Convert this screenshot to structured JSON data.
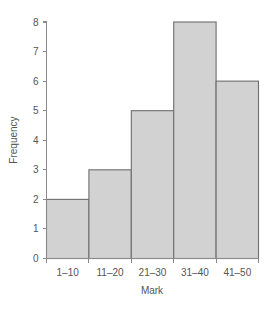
{
  "chart_data": {
    "type": "bar",
    "title": "",
    "subtitle": "",
    "xlabel": "Mark",
    "ylabel": "Frequency",
    "categories": [
      "1–10",
      "11–20",
      "21–30",
      "31–40",
      "41–50"
    ],
    "values": [
      2,
      3,
      5,
      8,
      6
    ],
    "series": [
      {
        "name": "Frequency",
        "values": [
          2,
          3,
          5,
          8,
          6
        ]
      }
    ],
    "ylim": [
      0,
      8
    ],
    "xlim": [
      0,
      5
    ],
    "y_ticks": [
      0,
      1,
      2,
      3,
      4,
      5,
      6,
      7,
      8
    ],
    "y_tick_labels": [
      "0",
      "1",
      "2",
      "3",
      "4",
      "5",
      "6",
      "7",
      "8"
    ],
    "x_tick_labels": [
      "1–10",
      "11–20",
      "21–30",
      "31–40",
      "41–50"
    ],
    "grid": false,
    "legend": false,
    "legend_position": "none",
    "bar_gap": 0,
    "annotations": [],
    "colors": {
      "bar_fill": "#d2d2d2",
      "bar_stroke": "#6e6e6e",
      "axis": "#8a8a8a",
      "text": "#555555",
      "background": "#ffffff"
    }
  }
}
